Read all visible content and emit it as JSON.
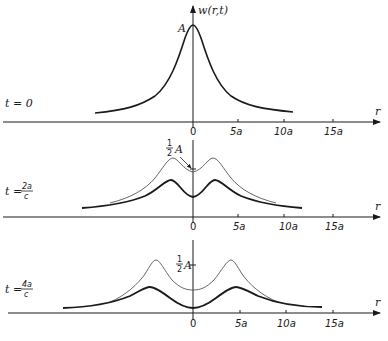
{
  "figure": {
    "y_axis_label": "w(r,t)",
    "x_axis_label": "r",
    "amplitude_label": "A",
    "half_amplitude_label": {
      "numerator": "1",
      "denominator": "2",
      "symbol": "A"
    },
    "tick_labels": [
      "0",
      "5a",
      "10a",
      "15a"
    ]
  },
  "panels": [
    {
      "time_label": "t = 0",
      "time_prefix": "t = ",
      "time_value": "0"
    },
    {
      "time_label": "t = 2a/c",
      "time_prefix": "t = ",
      "time_numerator": "2a",
      "time_denominator": "c"
    },
    {
      "time_label": "t = 4a/c",
      "time_prefix": "t = ",
      "time_numerator": "4a",
      "time_denominator": "c"
    }
  ]
}
